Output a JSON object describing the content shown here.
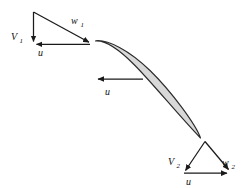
{
  "figure": {
    "background_color": "#ffffff",
    "line_color": "#1a1a1a",
    "blade_fill_color": "#d8d8d8",
    "blade_outline_color": "#2b2b2b"
  },
  "inlet_triangle": {
    "name": "inlet velocity triangle",
    "labels": {
      "absolute_velocity": "V",
      "absolute_velocity_sub": "1",
      "relative_velocity": "w",
      "relative_velocity_sub": "1",
      "blade_speed": "u"
    }
  },
  "outlet_triangle": {
    "name": "outlet velocity triangle",
    "labels": {
      "absolute_velocity": "V",
      "absolute_velocity_sub": "2",
      "relative_velocity": "w",
      "relative_velocity_sub": "2",
      "blade_speed": "u"
    }
  },
  "blade_speed_vector": {
    "name": "blade speed vector",
    "label": "u"
  }
}
